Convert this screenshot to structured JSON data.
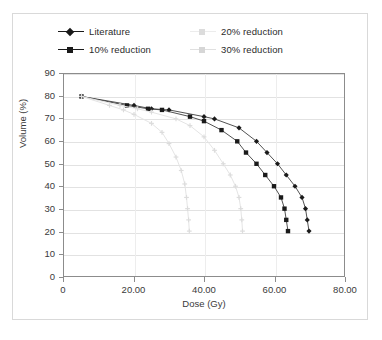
{
  "chart_data": {
    "type": "line",
    "title": "",
    "xlabel": "Dose (Gy)",
    "ylabel": "Volume (%)",
    "xlim": [
      0,
      80
    ],
    "ylim": [
      0,
      90
    ],
    "xticks": [
      "0",
      "20.00",
      "40.00",
      "60.00",
      "80.00"
    ],
    "xtick_values": [
      0,
      20,
      40,
      60,
      80
    ],
    "yticks": [
      "0",
      "10",
      "20",
      "30",
      "40",
      "50",
      "60",
      "70",
      "80",
      "90"
    ],
    "ytick_values": [
      0,
      10,
      20,
      30,
      40,
      50,
      60,
      70,
      80,
      90
    ],
    "grid": "horizontal-and-vertical",
    "legend_position": "top",
    "series": [
      {
        "name": "Literature",
        "marker": "diamond",
        "color": "#1a1a1a",
        "points": [
          [
            5.0,
            80
          ],
          [
            20.0,
            76
          ],
          [
            25.0,
            74.5
          ],
          [
            30.0,
            74
          ],
          [
            40.0,
            71
          ],
          [
            43.0,
            70
          ],
          [
            50.0,
            66
          ],
          [
            55.0,
            60
          ],
          [
            58.0,
            55
          ],
          [
            61.0,
            50
          ],
          [
            63.5,
            45
          ],
          [
            66.0,
            40
          ],
          [
            68.0,
            35
          ],
          [
            69.0,
            30
          ],
          [
            69.5,
            25
          ],
          [
            70.0,
            20
          ]
        ]
      },
      {
        "name": "10% reduction",
        "marker": "square",
        "color": "#1a1a1a",
        "points": [
          [
            5.0,
            80
          ],
          [
            18.0,
            76
          ],
          [
            24.0,
            74.5
          ],
          [
            28.0,
            74
          ],
          [
            36.0,
            71
          ],
          [
            40.0,
            69
          ],
          [
            45.0,
            65
          ],
          [
            49.5,
            60
          ],
          [
            52.0,
            55
          ],
          [
            55.0,
            50
          ],
          [
            57.5,
            45
          ],
          [
            60.0,
            40
          ],
          [
            62.0,
            35
          ],
          [
            63.0,
            30
          ],
          [
            63.5,
            25
          ],
          [
            64.0,
            20
          ]
        ]
      },
      {
        "name": "20% reduction",
        "marker": "cross",
        "color": "#e2e2e2",
        "points": [
          [
            5.0,
            80
          ],
          [
            16.0,
            76
          ],
          [
            21.0,
            74.5
          ],
          [
            25.0,
            73
          ],
          [
            32.0,
            70
          ],
          [
            36.0,
            67
          ],
          [
            40.0,
            62
          ],
          [
            43.0,
            56
          ],
          [
            45.5,
            50
          ],
          [
            47.5,
            45
          ],
          [
            49.0,
            40
          ],
          [
            50.0,
            35
          ],
          [
            50.5,
            30
          ],
          [
            50.8,
            25
          ],
          [
            51.0,
            20
          ]
        ]
      },
      {
        "name": "30% reduction",
        "marker": "cross",
        "color": "#e2e2e2",
        "points": [
          [
            5.0,
            80
          ],
          [
            13.0,
            76
          ],
          [
            17.0,
            74
          ],
          [
            20.0,
            72
          ],
          [
            25.0,
            68
          ],
          [
            28.0,
            64
          ],
          [
            30.0,
            59
          ],
          [
            32.0,
            53
          ],
          [
            33.5,
            47
          ],
          [
            34.5,
            41
          ],
          [
            35.0,
            35
          ],
          [
            35.3,
            30
          ],
          [
            35.6,
            25
          ],
          [
            35.8,
            20
          ]
        ]
      }
    ]
  },
  "legend": {
    "entries": [
      {
        "label": "Literature",
        "color": "#1a1a1a",
        "marker": "diamond"
      },
      {
        "label": "10% reduction",
        "color": "#1a1a1a",
        "marker": "square"
      },
      {
        "label": "20% reduction",
        "color": "#e2e2e2",
        "marker": "cross"
      },
      {
        "label": "30% reduction",
        "color": "#e2e2e2",
        "marker": "cross"
      }
    ]
  },
  "colors": {
    "plot_frame": "#8c8c8c",
    "outer_frame": "#d9d9d9",
    "grid": "#e2e2e2",
    "text": "#3a3a3a",
    "dark_series": "#1a1a1a",
    "light_series": "#e2e2e2",
    "background": "#ffffff"
  }
}
